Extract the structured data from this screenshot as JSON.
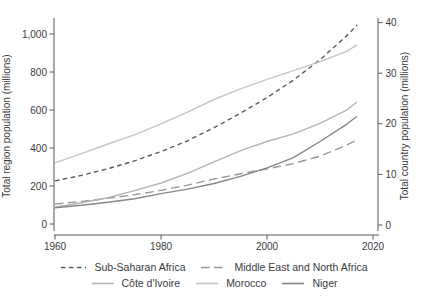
{
  "chart_data": {
    "type": "line",
    "x": [
      1960,
      1965,
      1970,
      1975,
      1980,
      1985,
      1990,
      1995,
      2000,
      2005,
      2010,
      2015,
      2017
    ],
    "x_tick_years": [
      1960,
      1980,
      2000,
      2020
    ],
    "x_tick_labels": [
      "1960",
      "1980",
      "2000",
      "2020"
    ],
    "x_range": [
      1960,
      2020
    ],
    "grid": false,
    "legend_position": "bottom",
    "left_axis": {
      "label": "Total region population (millions)",
      "ticks": [
        0,
        200,
        400,
        600,
        800,
        1000
      ],
      "tick_labels": [
        "0",
        "200",
        "400",
        "600",
        "800",
        "1,000"
      ],
      "range": [
        0,
        1090
      ]
    },
    "right_axis": {
      "label": "Total country population (millions)",
      "ticks": [
        0,
        10,
        20,
        30,
        40
      ],
      "tick_labels": [
        "0",
        "10",
        "20",
        "30",
        "40"
      ],
      "range": [
        0,
        41
      ]
    },
    "series": [
      {
        "name": "Sub-Saharan Africa",
        "axis": "left",
        "line_style": "short-dash",
        "color": "#5a5b5e",
        "values": [
          227,
          256,
          291,
          332,
          381,
          438,
          507,
          583,
          665,
          758,
          865,
          990,
          1047
        ]
      },
      {
        "name": "Middle East and North Africa",
        "axis": "left",
        "line_style": "long-dash",
        "color": "#97989b",
        "values": [
          105,
          119,
          135,
          154,
          177,
          205,
          237,
          264,
          290,
          318,
          357,
          415,
          443
        ]
      },
      {
        "name": "Côte d'Ivoire",
        "axis": "right",
        "line_style": "solid",
        "color": "#b3b5ae",
        "values": [
          3.5,
          4.4,
          5.4,
          6.8,
          8.3,
          10.2,
          12.5,
          14.7,
          16.5,
          18.0,
          20.1,
          22.7,
          24.3
        ]
      },
      {
        "name": "Morocco",
        "axis": "right",
        "line_style": "solid",
        "color": "#c4c6c0",
        "values": [
          12.3,
          14.1,
          16.0,
          17.8,
          20.0,
          22.3,
          24.8,
          26.9,
          28.8,
          30.5,
          32.3,
          34.3,
          35.6
        ]
      },
      {
        "name": "Niger",
        "axis": "right",
        "line_style": "solid",
        "color": "#85878b",
        "values": [
          3.4,
          3.9,
          4.5,
          5.2,
          6.2,
          7.1,
          8.2,
          9.6,
          11.3,
          13.3,
          16.5,
          19.9,
          21.5
        ]
      }
    ],
    "axis_color": "#57575a"
  }
}
